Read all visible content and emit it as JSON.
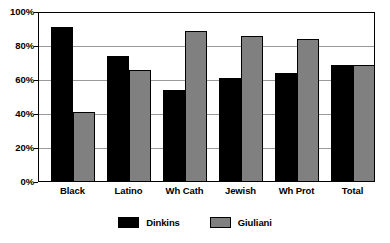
{
  "chart_data": {
    "type": "bar",
    "title": "",
    "xlabel": "",
    "ylabel": "",
    "categories": [
      "Black",
      "Latino",
      "Wh Cath",
      "Jewish",
      "Wh Prot",
      "Total"
    ],
    "series": [
      {
        "name": "Dinkins",
        "color": "#000000",
        "values": [
          91,
          74,
          54,
          61,
          64,
          69
        ]
      },
      {
        "name": "Giuliani",
        "color": "#808080",
        "values": [
          41,
          66,
          89,
          86,
          84,
          69
        ]
      }
    ],
    "ylim": [
      0,
      100
    ],
    "ytick_values": [
      0,
      20,
      40,
      60,
      80,
      100
    ],
    "ytick_labels": [
      "0%",
      "20%",
      "40%",
      "60%",
      "80%",
      "100%"
    ],
    "grid": true,
    "legend_position": "bottom",
    "frame": true
  },
  "legend": {
    "entries": [
      {
        "label": "Dinkins"
      },
      {
        "label": "Giuliani"
      }
    ]
  },
  "colors": {
    "series_1": "#000000",
    "series_2": "#808080",
    "grid": "#9a9a9a",
    "axis": "#000000",
    "background": "#ffffff"
  }
}
